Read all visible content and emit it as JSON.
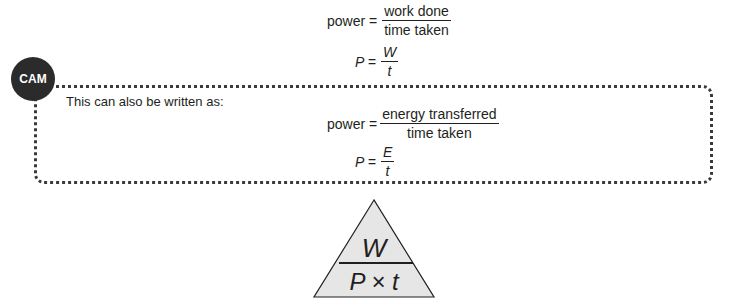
{
  "equation1": {
    "word_lhs": "power =",
    "word_num": "work done",
    "word_den": "time taken",
    "sym_lhs": "P =",
    "sym_num": "W",
    "sym_den": "t"
  },
  "cam_box": {
    "badge": "CAM",
    "intro": "This can also be written as:",
    "word_lhs": "power =",
    "word_num": "energy transferred",
    "word_den": "time taken",
    "sym_lhs": "P =",
    "sym_num": "E",
    "sym_den": "t"
  },
  "triangle": {
    "top": "W",
    "bottom": "P × t",
    "fill": "#e6e6e6"
  }
}
